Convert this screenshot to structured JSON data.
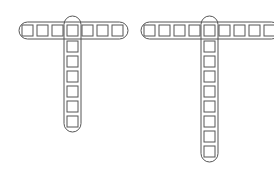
{
  "diagram": {
    "stroke_color": "#555555",
    "figures": [
      {
        "name": "left-t",
        "horizontal_squares": 7,
        "vertical_squares_below": 6,
        "shared_index": 3
      },
      {
        "name": "right-t",
        "horizontal_squares": 9,
        "vertical_squares_below": 8,
        "shared_index": 4
      }
    ]
  }
}
